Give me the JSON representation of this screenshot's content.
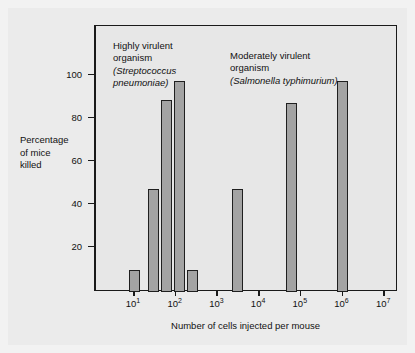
{
  "chart_data": {
    "type": "bar",
    "title": "",
    "xlabel": "Number of cells injected per mouse",
    "ylabel": "Percentage of mice killed",
    "xscale": "log",
    "xlim": [
      1,
      10000000
    ],
    "ylim": [
      0,
      112
    ],
    "grid": false,
    "legend_position": "none",
    "x_tick_labels": [
      "10",
      "10",
      "10",
      "10",
      "10",
      "10",
      "10"
    ],
    "x_tick_exponents": [
      "1",
      "2",
      "3",
      "4",
      "5",
      "6",
      "7"
    ],
    "x_tick_values": [
      10,
      100,
      1000,
      10000,
      100000,
      1000000,
      10000000
    ],
    "y_tick_labels": [
      "20",
      "40",
      "60",
      "80",
      "100"
    ],
    "y_tick_values": [
      20,
      40,
      60,
      80,
      100
    ],
    "series": [
      {
        "name": "Streptococcus pneumoniae",
        "x": [
          10,
          30,
          60,
          120,
          250
        ],
        "values": [
          10,
          48,
          89,
          98,
          10
        ]
      },
      {
        "name": "Salmonella typhimurium",
        "x": [
          3000,
          60000,
          1000000
        ],
        "values": [
          48,
          88,
          98
        ]
      }
    ],
    "annotations": [
      {
        "id": "strep",
        "line1": "Highly virulent",
        "line2": "organism",
        "line3": "(Streptococcus",
        "line4": "pneumoniae)"
      },
      {
        "id": "salm",
        "line1": "Moderately virulent",
        "line2": "organism",
        "line3": "(Salmonella typhimurium)"
      }
    ],
    "colors": {
      "bar_fill": "#a3a3a3",
      "bar_stroke": "#1f1f1f",
      "plot_background": "#e7e7e7",
      "figure_background": "#ebebeb",
      "axis": "#1a1a1a",
      "text": "#111111"
    }
  },
  "axes": {
    "y_title_line1": "Percentage",
    "y_title_line2": "of mice",
    "y_title_line3": "killed",
    "x_title": "Number of cells injected per mouse"
  }
}
